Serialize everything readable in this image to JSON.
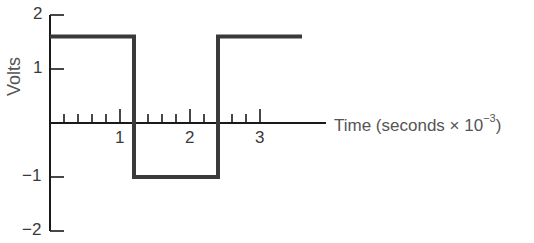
{
  "chart_data": {
    "type": "line",
    "title": "",
    "xlabel": "Time (seconds × 10^-3)",
    "xlabel_parts": {
      "main": "Time (seconds ×  10",
      "exp": "−3",
      "close": ")"
    },
    "ylabel": "Volts",
    "xlim": [
      0,
      3.9
    ],
    "ylim": [
      -2,
      2
    ],
    "x_ticks_major": [
      1,
      2,
      3
    ],
    "x_tick_labels": [
      "1",
      "2",
      "3"
    ],
    "x_minor_tick_step": 0.2,
    "y_ticks": [
      2,
      1,
      -1,
      -2
    ],
    "y_tick_labels": [
      "2",
      "1",
      "−1",
      "−2"
    ],
    "grid": false,
    "legend": null,
    "series": [
      {
        "name": "square wave",
        "shape": "step",
        "x": [
          0,
          1.2,
          1.2,
          2.4,
          2.4,
          3.6
        ],
        "y": [
          1.6,
          1.6,
          -1.0,
          -1.0,
          1.6,
          1.6
        ]
      }
    ]
  }
}
